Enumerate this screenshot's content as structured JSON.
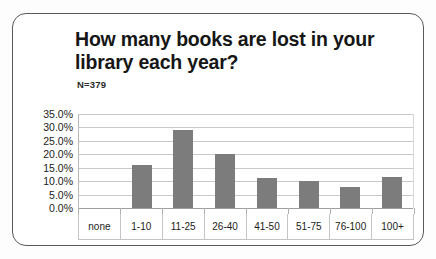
{
  "chart_data": {
    "type": "bar",
    "title": "How many books are lost in your library each year?",
    "subtitle": "N=379",
    "xlabel": "",
    "ylabel": "",
    "categories": [
      "none",
      "1-10",
      "11-25",
      "26-40",
      "41-50",
      "51-75",
      "76-100",
      "100+"
    ],
    "values": [
      0,
      16.0,
      29.0,
      20.0,
      11.0,
      10.0,
      8.0,
      11.5
    ],
    "value_labels": [
      "0.0%",
      "16.0%",
      "29.0%",
      "20.0%",
      "11.0%",
      "10.0%",
      "8.0%",
      "11.5%"
    ],
    "ylim": [
      0,
      35
    ],
    "ytick_labels": [
      "35.0%",
      "30.0%",
      "25.0%",
      "20.0%",
      "15.0%",
      "10.0%",
      "5.0%",
      "0.0%"
    ],
    "ytick_values": [
      35,
      30,
      25,
      20,
      15,
      10,
      5,
      0
    ],
    "grid": true,
    "legend": "none",
    "series_color": "#7c7c7c"
  }
}
